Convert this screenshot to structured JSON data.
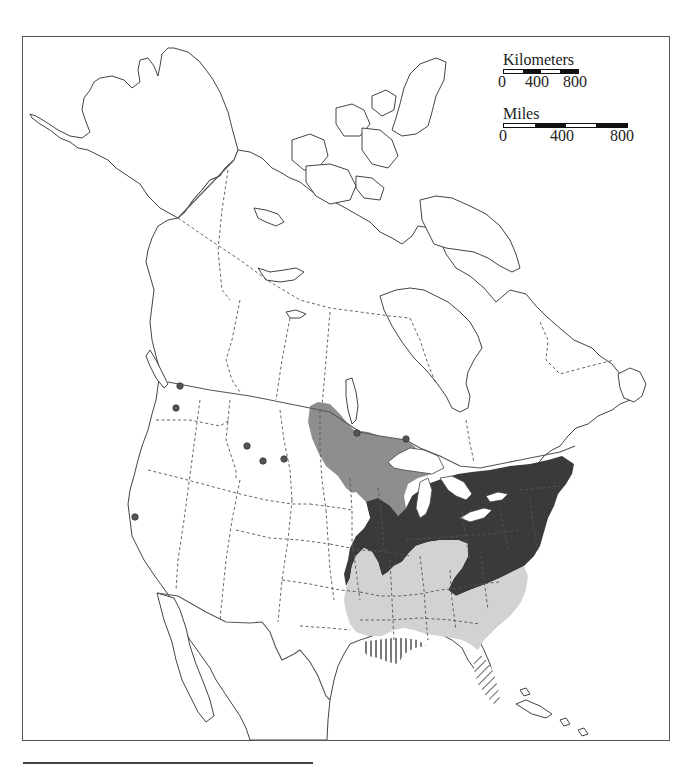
{
  "map": {
    "title": "",
    "region": "North America",
    "legend_fills": {
      "dark": "#3a3a3a",
      "medium": "#8e8e8e",
      "light": "#d2d2d2",
      "hatched": "vertical/diagonal hatch"
    },
    "outline_color": "#444444",
    "point_color": "#555555",
    "occurrence_points": [
      {
        "x": 180,
        "y": 386
      },
      {
        "x": 176,
        "y": 408
      },
      {
        "x": 247,
        "y": 446
      },
      {
        "x": 263,
        "y": 461
      },
      {
        "x": 284,
        "y": 459
      },
      {
        "x": 135,
        "y": 517
      },
      {
        "x": 357,
        "y": 433
      },
      {
        "x": 406,
        "y": 439
      }
    ]
  },
  "scale_km": {
    "label": "Kilometers",
    "ticks": [
      "0",
      "400",
      "800"
    ]
  },
  "scale_mi": {
    "label": "Miles",
    "ticks": [
      "0",
      "400",
      "800"
    ]
  }
}
